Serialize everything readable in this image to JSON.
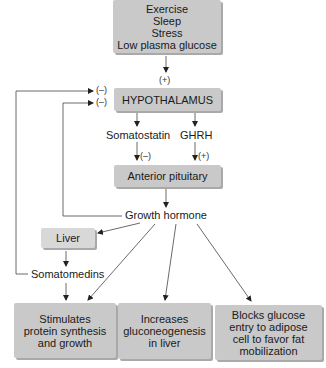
{
  "stimuli": {
    "lines": [
      "Exercise",
      "Sleep",
      "Stress",
      "Low plasma glucose"
    ]
  },
  "signs": {
    "stimuli_to_hypothalamus": "(+)",
    "feedback_outer": "(–)",
    "feedback_inner": "(–)",
    "somatostatin_effect": "(–)",
    "ghrh_effect": "(+)"
  },
  "nodes": {
    "hypothalamus": "HYPOTHALAMUS",
    "somatostatin": "Somatostatin",
    "ghrh": "GHRH",
    "anterior_pituitary": "Anterior pituitary",
    "growth_hormone": "Growth hormone",
    "liver": "Liver",
    "somatomedins": "Somatomedins"
  },
  "effects": [
    {
      "lines": [
        "Stimulates",
        "protein synthesis",
        "and growth"
      ]
    },
    {
      "lines": [
        "Increases",
        "gluconeogenesis",
        "in liver"
      ]
    },
    {
      "lines": [
        "Blocks glucose",
        "entry to adipose",
        "cell to favor fat",
        "mobilization"
      ]
    }
  ],
  "colors": {
    "box_fill": "#c9c9c9",
    "box_shadow": "#a9a9a9",
    "line": "#333333"
  }
}
